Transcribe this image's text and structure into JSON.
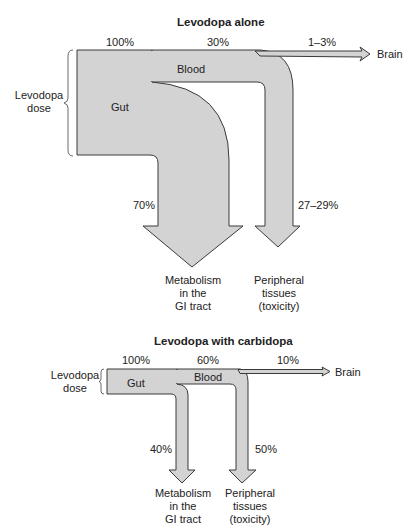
{
  "colors": {
    "flow_fill": "#d3d3d3",
    "flow_stroke": "#3a3a3a",
    "text": "#222222"
  },
  "diagrams": [
    {
      "title": "Levodopa alone",
      "dose_label_1": "Levodopa",
      "dose_label_2": "dose",
      "pct_dose": "100%",
      "pct_blood": "30%",
      "pct_brain": "1–3%",
      "pct_gut_metabolism": "70%",
      "pct_peripheral": "27–29%",
      "gut_label": "Gut",
      "blood_label": "Blood",
      "brain_label": "Brain",
      "metab_1": "Metabolism",
      "metab_2": "in the",
      "metab_3": "GI tract",
      "periph_1": "Peripheral",
      "periph_2": "tissues",
      "periph_3": "(toxicity)"
    },
    {
      "title": "Levodopa with carbidopa",
      "dose_label_1": "Levodopa",
      "dose_label_2": "dose",
      "pct_dose": "100%",
      "pct_blood": "60%",
      "pct_brain": "10%",
      "pct_gut_metabolism": "40%",
      "pct_peripheral": "50%",
      "gut_label": "Gut",
      "blood_label": "Blood",
      "brain_label": "Brain",
      "metab_1": "Metabolism",
      "metab_2": "in the",
      "metab_3": "GI tract",
      "periph_1": "Peripheral",
      "periph_2": "tissues",
      "periph_3": "(toxicity)"
    }
  ]
}
